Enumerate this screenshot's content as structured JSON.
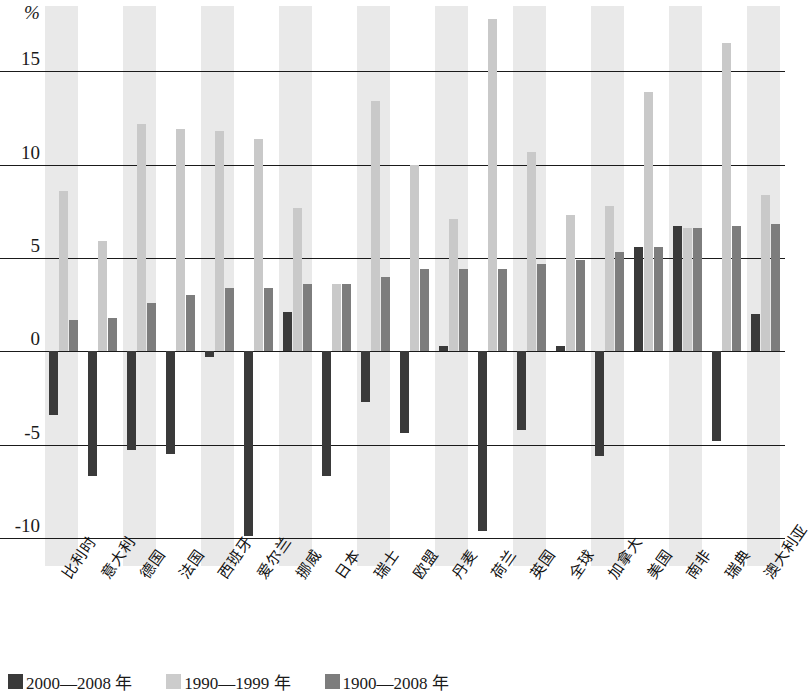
{
  "chart_data": {
    "type": "bar",
    "title": "",
    "subtitle": "",
    "xlabel": "",
    "ylabel": "%",
    "unit": "%",
    "ylim": [
      -11.5,
      18.5
    ],
    "yticks": [
      15,
      10,
      5,
      0,
      -5,
      -10
    ],
    "ytick_labels": [
      "15",
      "10",
      "5",
      "0",
      "-5",
      "-10"
    ],
    "grid": true,
    "grid_axis": "y",
    "legend_position": "bottom",
    "categories": [
      "比利时",
      "意大利",
      "德国",
      "法国",
      "西班牙",
      "爱尔兰",
      "挪威",
      "日本",
      "瑞士",
      "欧盟",
      "丹麦",
      "荷兰",
      "英国",
      "全球",
      "加拿大",
      "美国",
      "南非",
      "瑞典",
      "澳大利亚"
    ],
    "series": [
      {
        "name": "2000—2008 年",
        "color": "#3a3a3a",
        "values": [
          -3.4,
          -6.7,
          -5.3,
          -5.5,
          -0.3,
          -9.9,
          2.1,
          -6.7,
          -2.7,
          -4.4,
          0.3,
          -9.6,
          -4.2,
          0.3,
          -5.6,
          5.6,
          6.7,
          -4.8,
          2.0
        ]
      },
      {
        "name": "1990—1999 年",
        "color": "#c9c9c9",
        "values": [
          8.6,
          5.9,
          12.2,
          11.9,
          11.8,
          11.4,
          7.7,
          3.6,
          13.4,
          10.0,
          7.1,
          17.8,
          10.7,
          7.3,
          7.8,
          13.9,
          6.6,
          16.5,
          8.4
        ]
      },
      {
        "name": "1900—2008 年",
        "color": "#7d7d7d",
        "values": [
          1.7,
          1.8,
          2.6,
          3.0,
          3.4,
          3.4,
          3.6,
          3.6,
          4.0,
          4.4,
          4.4,
          4.4,
          4.7,
          4.9,
          5.3,
          5.6,
          6.6,
          6.7,
          6.8
        ]
      }
    ]
  },
  "legend": {
    "items": [
      {
        "label": "2000—2008 年",
        "swatch": "s0"
      },
      {
        "label": "1990—1999 年",
        "swatch": "s1"
      },
      {
        "label": "1900—2008 年",
        "swatch": "s2"
      }
    ]
  }
}
